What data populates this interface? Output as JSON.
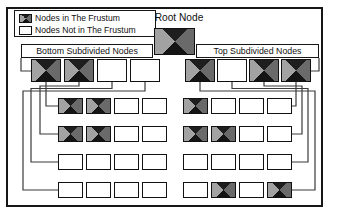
{
  "figure_title": "frustum-quadtree-diagram",
  "legend": {
    "items": [
      {
        "label": "Nodes in The Frustum",
        "filled": true
      },
      {
        "label": "Nodes Not in The Frustum",
        "filled": false
      }
    ]
  },
  "root": {
    "label": "Root Node",
    "filled": true
  },
  "groups": [
    {
      "title": "Bottom Subdivided Nodes",
      "side": "left",
      "nodes": [
        true,
        true,
        false,
        false
      ]
    },
    {
      "title": "Top Subdivided Nodes",
      "side": "right",
      "nodes": [
        true,
        false,
        true,
        true
      ]
    }
  ],
  "rows": {
    "left": [
      [
        true,
        true,
        false,
        false
      ],
      [
        true,
        true,
        false,
        false
      ],
      [
        false,
        false,
        false,
        false
      ],
      [
        false,
        false,
        false,
        false
      ]
    ],
    "right": [
      [
        true,
        false,
        false,
        false
      ],
      [
        true,
        true,
        false,
        false
      ],
      [
        false,
        false,
        false,
        false
      ],
      [
        false,
        true,
        false,
        true
      ]
    ]
  },
  "colors": {
    "node_triangle_dark": "#141414",
    "node_triangle_left": "#a2a2a2",
    "node_triangle_right": "#6a6a6a",
    "node_border": "#111111",
    "connector_line": "#3a3a3a",
    "background": "#ffffff"
  }
}
